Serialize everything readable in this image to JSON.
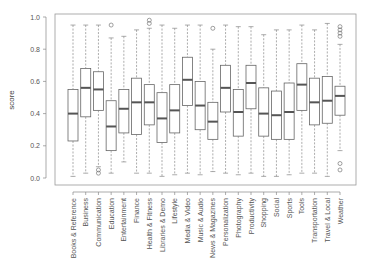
{
  "chart_data": {
    "type": "boxplot",
    "title": "",
    "xlabel": "",
    "ylabel": "score",
    "ylim": [
      0,
      1
    ],
    "yticks": [
      "0.0",
      "0.2",
      "0.4",
      "0.6",
      "0.8",
      "1.0"
    ],
    "grid": false,
    "legend": null,
    "categories": [
      "Books & Reference",
      "Business",
      "Communication",
      "Education",
      "Entertainment",
      "Finance",
      "Health & Fitness",
      "Libraries & Demo",
      "Lifestyle",
      "Media & Video",
      "Music & Audio",
      "News & Magazines",
      "Personalization",
      "Photography",
      "Productivity",
      "Shopping",
      "Social",
      "Sports",
      "Tools",
      "Transportation",
      "Travel & Local",
      "Weather"
    ],
    "boxes": [
      {
        "low": 0.01,
        "q1": 0.23,
        "median": 0.4,
        "q3": 0.55,
        "high": 0.95,
        "outliers": []
      },
      {
        "low": 0.03,
        "q1": 0.38,
        "median": 0.56,
        "q3": 0.68,
        "high": 0.95,
        "outliers": []
      },
      {
        "low": 0.07,
        "q1": 0.42,
        "median": 0.55,
        "q3": 0.66,
        "high": 0.95,
        "outliers": [
          0.03,
          0.05
        ]
      },
      {
        "low": 0.03,
        "q1": 0.17,
        "median": 0.32,
        "q3": 0.48,
        "high": 0.87,
        "outliers": [
          0.95
        ]
      },
      {
        "low": 0.1,
        "q1": 0.28,
        "median": 0.43,
        "q3": 0.55,
        "high": 0.88,
        "outliers": []
      },
      {
        "low": 0.03,
        "q1": 0.27,
        "median": 0.47,
        "q3": 0.62,
        "high": 0.92,
        "outliers": []
      },
      {
        "low": 0.03,
        "q1": 0.33,
        "median": 0.47,
        "q3": 0.58,
        "high": 0.93,
        "outliers": [
          0.96,
          0.98
        ]
      },
      {
        "low": 0.01,
        "q1": 0.22,
        "median": 0.37,
        "q3": 0.53,
        "high": 0.95,
        "outliers": []
      },
      {
        "low": 0.02,
        "q1": 0.28,
        "median": 0.42,
        "q3": 0.58,
        "high": 0.93,
        "outliers": []
      },
      {
        "low": 0.03,
        "q1": 0.45,
        "median": 0.61,
        "q3": 0.75,
        "high": 0.95,
        "outliers": []
      },
      {
        "low": 0.02,
        "q1": 0.3,
        "median": 0.45,
        "q3": 0.6,
        "high": 0.95,
        "outliers": []
      },
      {
        "low": 0.04,
        "q1": 0.24,
        "median": 0.35,
        "q3": 0.47,
        "high": 0.8,
        "outliers": [
          0.93
        ]
      },
      {
        "low": 0.03,
        "q1": 0.41,
        "median": 0.56,
        "q3": 0.7,
        "high": 0.95,
        "outliers": []
      },
      {
        "low": 0.02,
        "q1": 0.26,
        "median": 0.41,
        "q3": 0.55,
        "high": 0.94,
        "outliers": []
      },
      {
        "low": 0.03,
        "q1": 0.43,
        "median": 0.59,
        "q3": 0.7,
        "high": 0.94,
        "outliers": []
      },
      {
        "low": 0.01,
        "q1": 0.26,
        "median": 0.4,
        "q3": 0.56,
        "high": 0.89,
        "outliers": []
      },
      {
        "low": 0.01,
        "q1": 0.24,
        "median": 0.39,
        "q3": 0.54,
        "high": 0.92,
        "outliers": []
      },
      {
        "low": 0.02,
        "q1": 0.24,
        "median": 0.41,
        "q3": 0.59,
        "high": 0.92,
        "outliers": []
      },
      {
        "low": 0.03,
        "q1": 0.42,
        "median": 0.58,
        "q3": 0.71,
        "high": 0.95,
        "outliers": []
      },
      {
        "low": 0.03,
        "q1": 0.33,
        "median": 0.47,
        "q3": 0.62,
        "high": 0.92,
        "outliers": []
      },
      {
        "low": 0.01,
        "q1": 0.34,
        "median": 0.48,
        "q3": 0.63,
        "high": 0.96,
        "outliers": []
      },
      {
        "low": 0.17,
        "q1": 0.39,
        "median": 0.51,
        "q3": 0.57,
        "high": 0.83,
        "outliers": [
          0.88,
          0.9,
          0.92,
          0.94,
          0.09,
          0.05
        ]
      }
    ]
  },
  "colors": {
    "box_stroke": "#666666",
    "median": "#555555",
    "whisker": "#888888",
    "frame": "#999999"
  }
}
